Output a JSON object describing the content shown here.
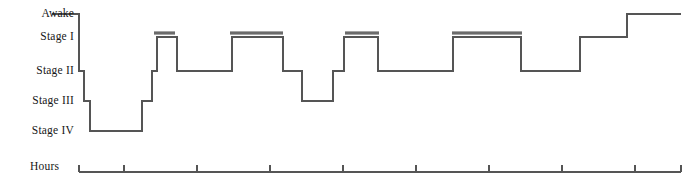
{
  "figure": {
    "title": "",
    "background": "#ffffff",
    "line_color": "#555555",
    "rem_bar_color": "#6b6b6b",
    "axis_color": "#555555",
    "text_color": "#171717"
  },
  "axes": {
    "y_label_items": [
      {
        "name": "awake",
        "label": "Awake",
        "y": 14
      },
      {
        "name": "stage-1",
        "label": "Stage I",
        "y": 37
      },
      {
        "name": "stage-2",
        "label": "Stage II",
        "y": 71
      },
      {
        "name": "stage-3",
        "label": "Stage III",
        "y": 101
      },
      {
        "name": "stage-4",
        "label": "Stage IV",
        "y": 131
      }
    ],
    "x_axis": {
      "label": "Hours",
      "label_x": 30,
      "label_y": 167,
      "y": 172,
      "x_start": 79,
      "x_end": 681,
      "tick_height": 7,
      "ticks": [
        79,
        124,
        197,
        270,
        343,
        416,
        489,
        562,
        635,
        681
      ]
    }
  },
  "chart_data": {
    "type": "line",
    "xlabel": "Hours",
    "ylabel": "Sleep stage",
    "grid": false,
    "legend": "none",
    "stage_levels": [
      "Awake",
      "Stage I",
      "Stage II",
      "Stage III",
      "Stage IV"
    ],
    "stage_y_px": {
      "Awake": 14,
      "Stage I": 37,
      "Stage II": 71,
      "Stage III": 101,
      "Stage IV": 131
    },
    "xlim_px": [
      52,
      681
    ],
    "steps": [
      {
        "x_start": 52,
        "x_end": 79,
        "stage": "Awake"
      },
      {
        "x_start": 79,
        "x_end": 84,
        "stage": "Stage II"
      },
      {
        "x_start": 84,
        "x_end": 90,
        "stage": "Stage III"
      },
      {
        "x_start": 90,
        "x_end": 142,
        "stage": "Stage IV"
      },
      {
        "x_start": 142,
        "x_end": 152,
        "stage": "Stage III"
      },
      {
        "x_start": 152,
        "x_end": 157,
        "stage": "Stage II"
      },
      {
        "x_start": 157,
        "x_end": 177,
        "stage": "Stage I"
      },
      {
        "x_start": 177,
        "x_end": 232,
        "stage": "Stage II"
      },
      {
        "x_start": 232,
        "x_end": 283,
        "stage": "Stage I"
      },
      {
        "x_start": 283,
        "x_end": 302,
        "stage": "Stage II"
      },
      {
        "x_start": 302,
        "x_end": 333,
        "stage": "Stage III"
      },
      {
        "x_start": 333,
        "x_end": 344,
        "stage": "Stage II"
      },
      {
        "x_start": 344,
        "x_end": 378,
        "stage": "Stage I"
      },
      {
        "x_start": 378,
        "x_end": 453,
        "stage": "Stage II"
      },
      {
        "x_start": 453,
        "x_end": 521,
        "stage": "Stage I"
      },
      {
        "x_start": 521,
        "x_end": 580,
        "stage": "Stage II"
      },
      {
        "x_start": 580,
        "x_end": 627,
        "stage": "Stage I"
      },
      {
        "x_start": 627,
        "x_end": 681,
        "stage": "Awake"
      }
    ],
    "rem_bars": [
      {
        "name": "rem-bar-1",
        "x_start": 154,
        "x_end": 175,
        "y": 33
      },
      {
        "name": "rem-bar-2",
        "x_start": 230,
        "x_end": 283,
        "y": 33
      },
      {
        "name": "rem-bar-3",
        "x_start": 345,
        "x_end": 379,
        "y": 33
      },
      {
        "name": "rem-bar-4",
        "x_start": 452,
        "x_end": 522,
        "y": 33
      }
    ]
  }
}
